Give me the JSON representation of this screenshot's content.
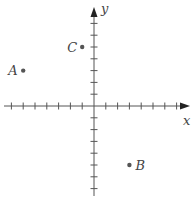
{
  "diagram": {
    "type": "coordinate-plane",
    "axes": {
      "x_label": "x",
      "y_label": "y",
      "x_ticks": [
        -7,
        -6,
        -5,
        -4,
        -3,
        -2,
        -1,
        1,
        2,
        3,
        4,
        5,
        6,
        7
      ],
      "y_ticks": [
        -7,
        -6,
        -5,
        -4,
        -3,
        -2,
        -1,
        1,
        2,
        3,
        4,
        5,
        6,
        7
      ],
      "color": "#555555"
    },
    "points": [
      {
        "label": "A",
        "x": -6,
        "y": 3
      },
      {
        "label": "B",
        "x": 3,
        "y": -5
      },
      {
        "label": "C",
        "x": -1,
        "y": 5
      }
    ],
    "point_color": "#555555"
  }
}
